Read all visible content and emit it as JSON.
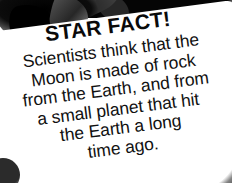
{
  "card": {
    "title": "STAR FACT!",
    "body_lines": [
      "Scientists think that the",
      "Moon is made of rock",
      "from the Earth, and from",
      "a small planet that hit",
      "the Earth a long",
      "time ago."
    ],
    "body_full_text": "Scientists think that the Moon is made of rock from the Earth, and from a small planet that hit the Earth a long time ago.",
    "colors": {
      "card_background": "#ffffff",
      "title_text": "#0a0a0a",
      "body_text": "#111111",
      "blob_dark": "#000000",
      "blob_gray": "#7a7a7a",
      "rim_gray": "#6e6e6e"
    },
    "decorations": [
      "top-left-dark-blob",
      "right-gray-curved-rim",
      "bottom-right-gray-arc",
      "bottom-left-dark-dot"
    ]
  }
}
